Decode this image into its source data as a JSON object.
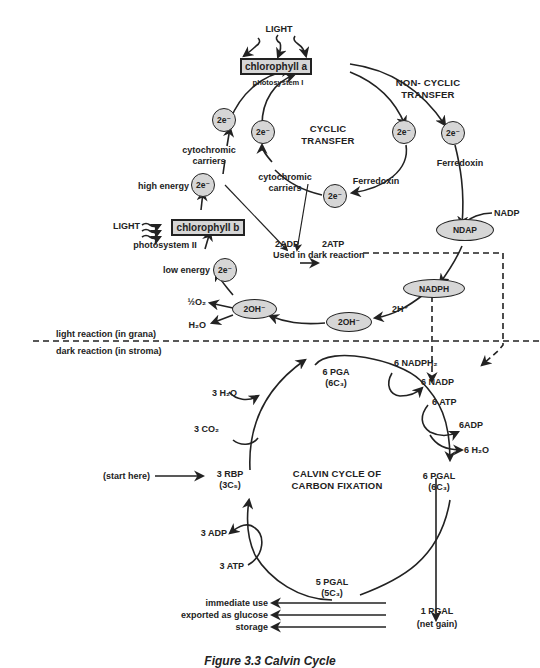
{
  "light_reaction": {
    "light_top": "LIGHT",
    "chlorophyll_a": "chlorophyll a",
    "photosystem_1": "photosystem I",
    "cyclic_title": [
      "CYCLIC",
      "TRANSFER"
    ],
    "noncyclic_title": [
      "NON- CYCLIC",
      "TRANSFER"
    ],
    "electron": "2e⁻",
    "cytochromic_left": [
      "cytochromic",
      "carriers"
    ],
    "cytochromic_center": [
      "cytochromic",
      "carriers"
    ],
    "ferredoxin_cyclic": "Ferredoxin",
    "ferredoxin_noncyclic": "Ferredoxin",
    "nadp": "NADP",
    "ndap": "NDAP",
    "nadph": "NADPH",
    "high_energy": "high energy",
    "low_energy": "low energy",
    "light_left": "LIGHT",
    "chlorophyll_b": "chlorophyll b",
    "photosystem_2": "photosystem II",
    "atp_reaction": "2ADP → 2ATP",
    "adp": "2ADP",
    "atp": "2ATP",
    "used_in_dark": "Used in dark reaction",
    "oh_left": "2OH⁻",
    "oh_right": "2OH⁻",
    "two_h_plus": "2H⁺",
    "half_o2": "½O₂",
    "water": "H₂O"
  },
  "divider": {
    "light_label": "light reaction (in grana)",
    "dark_label": "dark reaction (in stroma)"
  },
  "calvin_cycle": {
    "title": [
      "CALVIN CYCLE OF",
      "CARBON FIXATION"
    ],
    "pga": [
      "6 PGA",
      "(6C₃)"
    ],
    "nadph2": "6 NADPH₂",
    "nadp6": "6 NADP",
    "atp6": "6 ATP",
    "adp6": "6ADP",
    "water6": "6 H₂O",
    "pgal6": [
      "6 PGAL",
      "(6C₃)"
    ],
    "pgal5": [
      "5 PGAL",
      "(5C₃)"
    ],
    "rbp": [
      "3 RBP",
      "(3C₅)"
    ],
    "water3": "3  H₂O",
    "co2": "3 CO₂",
    "adp3": "3 ADP",
    "atp3": "3 ATP",
    "start": "(start here)",
    "pgal1": [
      "1 PGAL",
      "(net gain)"
    ]
  },
  "outputs": [
    "immediate use",
    "exported as glucose",
    "storage"
  ],
  "caption": "Figure 3.3  Calvin Cycle",
  "colors": {
    "node_fill": "#d6d6d6",
    "stroke": "#222222",
    "background": "#ffffff"
  }
}
